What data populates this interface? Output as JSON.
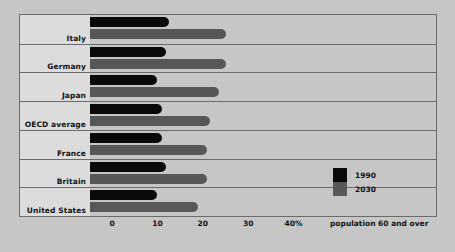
{
  "chart_data": {
    "type": "bar",
    "orientation": "horizontal",
    "title": "",
    "subtitle": "",
    "xlabel": "population 60 and over",
    "ylabel": "",
    "xlim": [
      0,
      45
    ],
    "xticks": [
      {
        "value": 0,
        "label": "0"
      },
      {
        "value": 10,
        "label": "10"
      },
      {
        "value": 20,
        "label": "20"
      },
      {
        "value": 30,
        "label": "30"
      },
      {
        "value": 40,
        "label": "40%"
      }
    ],
    "grid": false,
    "legend_position": "right-inside",
    "categories": [
      "Italy",
      "Germany",
      "Japan",
      "OECD average",
      "France",
      "Britain",
      "United States"
    ],
    "series": [
      {
        "name": "1990",
        "color": "#0a0a0a",
        "values": [
          12.5,
          12,
          10,
          11,
          11,
          12,
          10
        ]
      },
      {
        "name": "2030",
        "color": "#575757",
        "values": [
          25,
          25,
          23.5,
          21.5,
          21,
          21,
          19
        ]
      }
    ]
  },
  "legend": {
    "items": [
      {
        "label": "1990",
        "color": "#0a0a0a"
      },
      {
        "label": "2030",
        "color": "#575757"
      }
    ]
  },
  "colors": {
    "page_background": "#c6c6c6",
    "label_panel": "#dcdcdc",
    "frame": "#6b6b6b",
    "series_1990": "#0a0a0a",
    "series_2030": "#575757",
    "text": "#111111"
  }
}
